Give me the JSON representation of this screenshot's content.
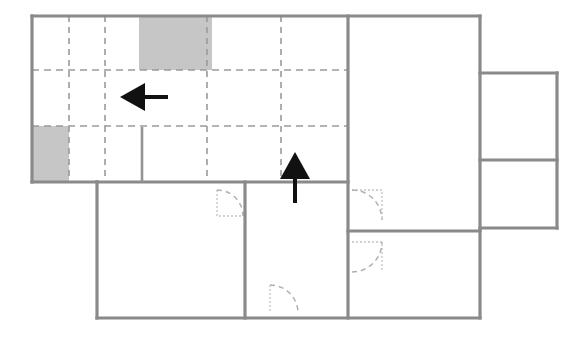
{
  "diagram": {
    "type": "floor-plan",
    "canvas": {
      "width": 586,
      "height": 339,
      "background": "#ffffff"
    },
    "colors": {
      "wall": "#8a8a8a",
      "grid_line": "#9a9a9a",
      "shaded_fill": "#c6c6c6",
      "arrow": "#111111",
      "door_arc": "#b0b0b0"
    },
    "outline": {
      "name": "building-outline",
      "points": "32,16 480,16 480,73 557,73 557,228 480,228 480,318 97,318 97,182 32,182 32,16"
    },
    "walls": [
      {
        "name": "wall-top-main",
        "x1": 32,
        "y1": 16,
        "x2": 480,
        "y2": 16
      },
      {
        "name": "wall-left-upper",
        "x1": 32,
        "y1": 16,
        "x2": 32,
        "y2": 182
      },
      {
        "name": "wall-upper-bottom-left",
        "x1": 32,
        "y1": 182,
        "x2": 97,
        "y2": 182
      },
      {
        "name": "wall-lowerleft-left",
        "x1": 97,
        "y1": 182,
        "x2": 97,
        "y2": 318
      },
      {
        "name": "wall-bottom-main",
        "x1": 97,
        "y1": 318,
        "x2": 480,
        "y2": 318
      },
      {
        "name": "wall-center-vertical",
        "x1": 348,
        "y1": 16,
        "x2": 348,
        "y2": 318
      },
      {
        "name": "wall-right-vertical",
        "x1": 480,
        "y1": 16,
        "x2": 480,
        "y2": 318
      },
      {
        "name": "wall-midband-horizontal",
        "x1": 97,
        "y1": 182,
        "x2": 348,
        "y2": 182
      },
      {
        "name": "wall-lowerleft-right",
        "x1": 245,
        "y1": 182,
        "x2": 245,
        "y2": 318
      },
      {
        "name": "wall-rightroom-divider",
        "x1": 348,
        "y1": 231,
        "x2": 480,
        "y2": 231
      },
      {
        "name": "wall-wing-top",
        "x1": 480,
        "y1": 73,
        "x2": 557,
        "y2": 73
      },
      {
        "name": "wall-wing-right",
        "x1": 557,
        "y1": 73,
        "x2": 557,
        "y2": 228
      },
      {
        "name": "wall-wing-bottom",
        "x1": 480,
        "y1": 228,
        "x2": 557,
        "y2": 228
      },
      {
        "name": "wall-wing-divider",
        "x1": 480,
        "y1": 160,
        "x2": 557,
        "y2": 160
      },
      {
        "name": "wall-stub-interior",
        "x1": 142,
        "y1": 127,
        "x2": 142,
        "y2": 182
      }
    ],
    "grid_lines_horizontal": [
      {
        "name": "grid-row-1",
        "y": 70,
        "x1": 32,
        "x2": 348
      },
      {
        "name": "grid-row-2",
        "y": 126,
        "x1": 32,
        "x2": 348
      }
    ],
    "grid_lines_vertical": [
      {
        "name": "grid-col-1",
        "x": 69,
        "y1": 16,
        "y2": 182
      },
      {
        "name": "grid-col-2",
        "x": 105,
        "y1": 16,
        "y2": 182
      },
      {
        "name": "grid-col-3",
        "x": 207,
        "y1": 16,
        "y2": 182
      },
      {
        "name": "grid-col-4",
        "x": 281,
        "y1": 16,
        "y2": 182
      }
    ],
    "shaded_cells": [
      {
        "name": "shaded-cell-top",
        "x": 139,
        "y": 17,
        "width": 73,
        "height": 53
      },
      {
        "name": "shaded-cell-left",
        "x": 33,
        "y": 126,
        "width": 36,
        "height": 56
      }
    ],
    "arrows": [
      {
        "name": "arrow-left",
        "direction": "left",
        "head": "120,97 145,83 145,111",
        "tail_x1": 145,
        "tail_y1": 97,
        "tail_x2": 168,
        "tail_y2": 97,
        "tail_width": 4
      },
      {
        "name": "arrow-up",
        "direction": "up",
        "head": "295,152 310,179 280,179",
        "tail_x1": 295,
        "tail_y1": 179,
        "tail_x2": 295,
        "tail_y2": 203,
        "tail_width": 4
      }
    ],
    "doors": [
      {
        "name": "door-lowerleft-top",
        "arc": "M 217,190 A 26 26 0 0 1 243,216",
        "leaf": "M 217,190 L 217,216 L 243,216"
      },
      {
        "name": "door-centerright-upper",
        "arc": "M 352,190 A 30 30 0 0 1 382,220",
        "leaf": "M 352,190 L 382,190 L 382,220"
      },
      {
        "name": "door-centerright-lower",
        "arc": "M 352,272 A 30 30 0 0 0 382,242",
        "leaf": "M 352,242 L 382,242 L 382,272"
      },
      {
        "name": "door-bottom-center",
        "arc": "M 270,285 A 28 28 0 0 1 298,313",
        "leaf": "M 270,285 L 270,313"
      }
    ]
  }
}
